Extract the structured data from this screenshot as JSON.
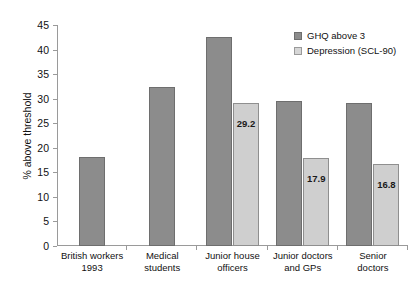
{
  "chart_data": {
    "type": "bar",
    "title": "",
    "xlabel": "",
    "ylabel": "% above threshold",
    "ylim": [
      0,
      45
    ],
    "yticks": [
      0,
      5,
      10,
      15,
      20,
      25,
      30,
      35,
      40,
      45
    ],
    "grid": false,
    "legend_position": "top-right",
    "categories": [
      "British workers 1993",
      "Medical students",
      "Junior house officers",
      "Junior doctors and GPs",
      "Senior doctors"
    ],
    "category_lines": [
      [
        "British workers",
        "1993"
      ],
      [
        "Medical",
        "students"
      ],
      [
        "Junior house",
        "officers"
      ],
      [
        "Junior doctors",
        "and GPs"
      ],
      [
        "Senior",
        "doctors"
      ]
    ],
    "series": [
      {
        "name": "GHQ above 3",
        "color": "#8c8c8c",
        "values": [
          18.2,
          32.3,
          42.6,
          29.5,
          29.2
        ],
        "labels": [
          "",
          "",
          "",
          "",
          ""
        ]
      },
      {
        "name": "Depression (SCL-90)",
        "color": "#cfcfcf",
        "values": [
          null,
          null,
          29.2,
          17.9,
          16.8
        ],
        "labels": [
          "",
          "",
          "29.2",
          "17.9",
          "16.8"
        ]
      }
    ]
  },
  "legend": {
    "items": [
      {
        "label": "GHQ above 3",
        "swatch": "dark"
      },
      {
        "label": "Depression (SCL-90)",
        "swatch": "light"
      }
    ]
  },
  "axis": {
    "y_title": "% above threshold"
  }
}
